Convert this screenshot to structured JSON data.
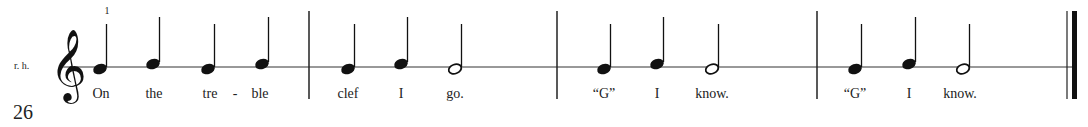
{
  "staff_label": "r. h.",
  "page_number": "26",
  "clef": "treble",
  "fingering": "1",
  "measures": [
    {
      "notes": [
        "quarter",
        "quarter",
        "quarter",
        "quarter"
      ],
      "lyrics": [
        "On",
        "the",
        "tre",
        "-",
        "ble"
      ]
    },
    {
      "notes": [
        "quarter",
        "quarter",
        "half"
      ],
      "lyrics": [
        "clef",
        "I",
        "go."
      ]
    },
    {
      "notes": [
        "quarter",
        "quarter",
        "half"
      ],
      "lyrics": [
        "“G”",
        "I",
        "know."
      ]
    },
    {
      "notes": [
        "quarter",
        "quarter",
        "half"
      ],
      "lyrics": [
        "“G”",
        "I",
        "know."
      ]
    }
  ]
}
